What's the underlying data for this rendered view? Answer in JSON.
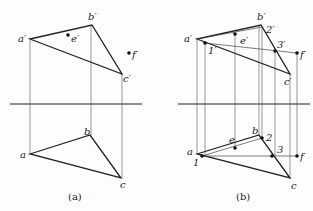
{
  "panels": [
    {
      "caption": "(a)",
      "points": {
        "a_prime": {
          "label": "a′",
          "x": 30,
          "y": 39
        },
        "b_prime": {
          "label": "b′",
          "x": 92,
          "y": 25
        },
        "c_prime": {
          "label": "c′",
          "x": 122,
          "y": 74
        },
        "e_prime": {
          "label": "e′",
          "x": 68,
          "y": 35
        },
        "f_prime": {
          "label": "f′",
          "x": 129,
          "y": 53
        },
        "a": {
          "label": "a",
          "x": 30,
          "y": 154
        },
        "b": {
          "label": "b",
          "x": 90,
          "y": 135
        },
        "c": {
          "label": "c",
          "x": 121,
          "y": 178
        }
      }
    },
    {
      "caption": "(b)",
      "points": {
        "a_prime": {
          "label": "a′",
          "x": 197,
          "y": 39
        },
        "b_prime": {
          "label": "b′",
          "x": 261,
          "y": 25
        },
        "c_prime": {
          "label": "c′",
          "x": 290,
          "y": 74
        },
        "one_prime": {
          "label": "1′",
          "x": 205,
          "y": 43
        },
        "two_prime": {
          "label": "2′",
          "x": 262,
          "y": 27
        },
        "three_prime": {
          "label": "3′",
          "x": 275,
          "y": 51
        },
        "e_prime": {
          "label": "e′",
          "x": 235,
          "y": 34
        },
        "f_prime": {
          "label": "f′",
          "x": 297,
          "y": 53
        },
        "a": {
          "label": "a",
          "x": 197,
          "y": 154
        },
        "b": {
          "label": "b",
          "x": 259,
          "y": 135
        },
        "c": {
          "label": "c",
          "x": 290,
          "y": 178
        },
        "one": {
          "label": "1",
          "x": 202,
          "y": 156
        },
        "two": {
          "label": "2",
          "x": 262,
          "y": 138
        },
        "three": {
          "label": "3",
          "x": 272,
          "y": 156
        },
        "e": {
          "label": "e",
          "x": 235,
          "y": 148
        },
        "f": {
          "label": "f",
          "x": 297,
          "y": 156
        }
      }
    }
  ],
  "axis_y": 104,
  "colors": {
    "line": "#222222",
    "thin": "#555555"
  }
}
